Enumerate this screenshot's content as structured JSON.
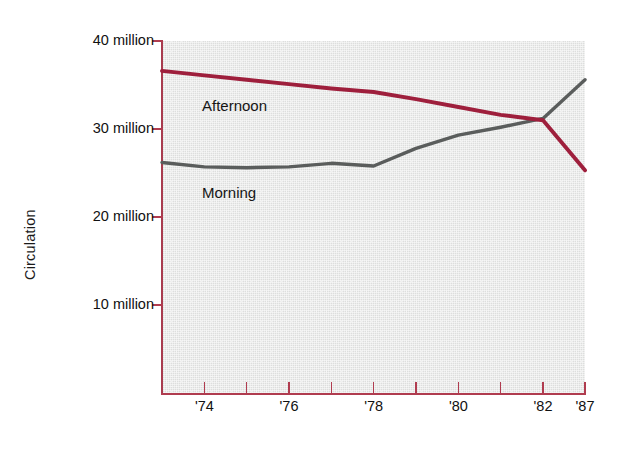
{
  "chart_data": {
    "type": "line",
    "title": "",
    "xlabel": "",
    "ylabel": "Circulation",
    "xlim": [
      1973,
      1987
    ],
    "ylim": [
      0,
      40
    ],
    "grid": false,
    "legend_position": "inline-labels",
    "y_unit": "million",
    "y_tick_values": [
      10,
      20,
      30,
      40
    ],
    "y_tick_labels": [
      "10 million",
      "20 million",
      "30 million",
      "40 million"
    ],
    "x_tick_values": [
      1974,
      1975,
      1976,
      1977,
      1978,
      1979,
      1980,
      1981,
      1982,
      1987
    ],
    "x_tick_labels": [
      "'74",
      "",
      "'76",
      "",
      "'78",
      "",
      "'80",
      "",
      "'82",
      "'87"
    ],
    "x_labeled_ticks": [
      {
        "value": 1974,
        "label": "'74"
      },
      {
        "value": 1976,
        "label": "'76"
      },
      {
        "value": 1978,
        "label": "'78"
      },
      {
        "value": 1980,
        "label": "'80"
      },
      {
        "value": 1982,
        "label": "'82"
      },
      {
        "value": 1987,
        "label": "'87"
      }
    ],
    "series": [
      {
        "name": "Afternoon",
        "color": "#9e1f3c",
        "label_text": "Afternoon",
        "x": [
          1973,
          1974,
          1975,
          1976,
          1977,
          1978,
          1979,
          1980,
          1981,
          1982,
          1987
        ],
        "values": [
          36.6,
          36.1,
          35.6,
          35.1,
          34.6,
          34.2,
          33.4,
          32.5,
          31.6,
          31.0,
          25.3
        ]
      },
      {
        "name": "Morning",
        "color": "#5a5d5c",
        "label_text": "Morning",
        "x": [
          1973,
          1974,
          1975,
          1976,
          1977,
          1978,
          1979,
          1980,
          1981,
          1982,
          1987
        ],
        "values": [
          26.2,
          25.7,
          25.6,
          25.7,
          26.1,
          25.8,
          27.8,
          29.3,
          30.2,
          31.2,
          35.6
        ]
      }
    ],
    "annotations": [
      {
        "text": "Afternoon",
        "x": 1974.6,
        "y": 33.0
      },
      {
        "text": "Morning",
        "x": 1974.6,
        "y": 23.5
      }
    ]
  },
  "colors": {
    "plot_background": "#dddedd",
    "axis": "#b03c4f",
    "afternoon_line": "#9e1f3c",
    "morning_line": "#5a5d5c",
    "text": "#111111",
    "page_background": "#ffffff"
  },
  "axis": {
    "y_title": "Circulation",
    "y_ticks": [
      {
        "label": "40 million",
        "value": 40
      },
      {
        "label": "30 million",
        "value": 30
      },
      {
        "label": "20 million",
        "value": 20
      },
      {
        "label": "10 million",
        "value": 10
      }
    ],
    "x_ticks": [
      {
        "label": "'74",
        "value": 1974
      },
      {
        "label": "",
        "value": 1975
      },
      {
        "label": "'76",
        "value": 1976
      },
      {
        "label": "",
        "value": 1977
      },
      {
        "label": "'78",
        "value": 1978
      },
      {
        "label": "",
        "value": 1979
      },
      {
        "label": "'80",
        "value": 1980
      },
      {
        "label": "",
        "value": 1981
      },
      {
        "label": "'82",
        "value": 1982
      },
      {
        "label": "'87",
        "value": 1987
      }
    ]
  },
  "labels": {
    "afternoon": "Afternoon",
    "morning": "Morning"
  }
}
